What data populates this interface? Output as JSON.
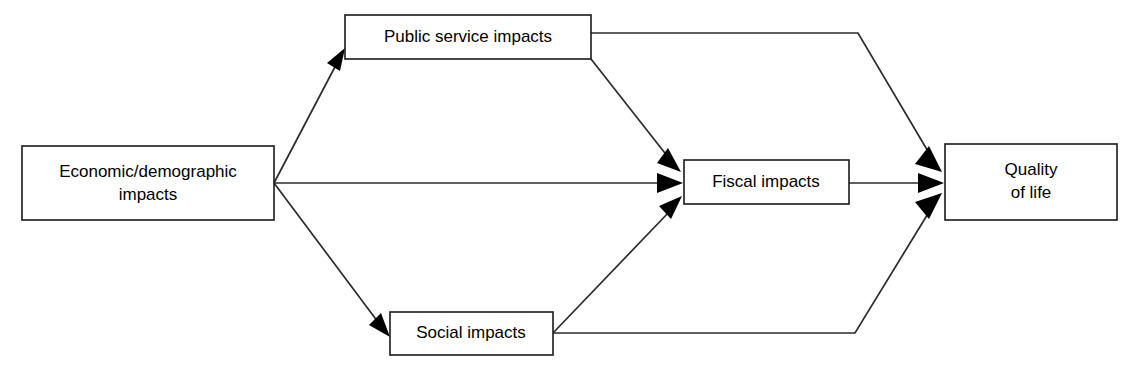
{
  "diagram": {
    "background_color": "#ffffff",
    "line_color": "#2b2b2b",
    "text_color": "#000000",
    "box_fill": "#ffffff",
    "nodes": [
      {
        "id": "economic",
        "label_line1": "Economic/demographic",
        "label_line2": "impacts",
        "x": 22,
        "y": 146,
        "w": 252,
        "h": 74
      },
      {
        "id": "public_service",
        "label_line1": "Public service impacts",
        "label_line2": "",
        "x": 345,
        "y": 15,
        "w": 246,
        "h": 44
      },
      {
        "id": "social",
        "label_line1": "Social impacts",
        "label_line2": "",
        "x": 390,
        "y": 312,
        "w": 163,
        "h": 43
      },
      {
        "id": "fiscal",
        "label_line1": "Fiscal impacts",
        "label_line2": "",
        "x": 684,
        "y": 160,
        "w": 165,
        "h": 44
      },
      {
        "id": "quality",
        "label_line1": "Quality",
        "label_line2": "of life",
        "x": 945,
        "y": 144,
        "w": 172,
        "h": 76
      }
    ],
    "edges": [
      {
        "id": "economic-to-public-service",
        "from": "economic",
        "to": "public_service",
        "shape": "diagonal-up"
      },
      {
        "id": "economic-to-fiscal",
        "from": "economic",
        "to": "fiscal",
        "shape": "horizontal"
      },
      {
        "id": "economic-to-social",
        "from": "economic",
        "to": "social",
        "shape": "diagonal-down"
      },
      {
        "id": "public-service-to-fiscal",
        "from": "public_service",
        "to": "fiscal",
        "shape": "diagonal-down"
      },
      {
        "id": "public-service-to-quality",
        "from": "public_service",
        "to": "quality",
        "shape": "elbow-down"
      },
      {
        "id": "social-to-fiscal",
        "from": "social",
        "to": "fiscal",
        "shape": "diagonal-up"
      },
      {
        "id": "social-to-quality",
        "from": "social",
        "to": "quality",
        "shape": "elbow-up"
      },
      {
        "id": "fiscal-to-quality",
        "from": "fiscal",
        "to": "quality",
        "shape": "horizontal"
      }
    ]
  }
}
